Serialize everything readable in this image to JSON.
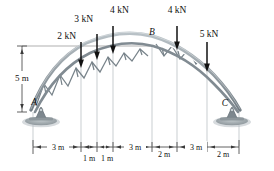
{
  "diagram": {
    "type": "arch-truss-free-body-diagram",
    "nodes": [
      {
        "id": "A",
        "label": "A",
        "role": "pin-support"
      },
      {
        "id": "B",
        "label": "B",
        "role": "apex-joint"
      },
      {
        "id": "C",
        "label": "C",
        "role": "pin-support"
      }
    ],
    "loads": [
      {
        "id": "load-1",
        "label": "2 kN",
        "magnitude": 2,
        "unit": "kN",
        "direction": "down",
        "station_m": 3
      },
      {
        "id": "load-2",
        "label": "3 kN",
        "magnitude": 3,
        "unit": "kN",
        "direction": "down",
        "station_m": 4
      },
      {
        "id": "load-3",
        "label": "4 kN",
        "magnitude": 4,
        "unit": "kN",
        "direction": "down",
        "station_m": 5
      },
      {
        "id": "load-4",
        "label": "4 kN",
        "magnitude": 4,
        "unit": "kN",
        "direction": "down",
        "station_m": 8
      },
      {
        "id": "load-5",
        "label": "5 kN",
        "magnitude": 5,
        "unit": "kN",
        "direction": "down",
        "station_m": 13
      }
    ],
    "height_dimension": {
      "label": "5 m",
      "value": 5,
      "unit": "m"
    },
    "span_dimensions_upper": [
      {
        "label": "3 m",
        "value": 3,
        "unit": "m"
      },
      {
        "label": "3 m",
        "value": 3,
        "unit": "m"
      },
      {
        "label": "3 m",
        "value": 3,
        "unit": "m"
      }
    ],
    "span_dimensions_lower": [
      {
        "label": "1 m",
        "value": 1,
        "unit": "m"
      },
      {
        "label": "1 m",
        "value": 1,
        "unit": "m"
      },
      {
        "label": "2 m",
        "value": 2,
        "unit": "m"
      },
      {
        "label": "2 m",
        "value": 2,
        "unit": "m"
      }
    ],
    "colors": {
      "truss": "#8d979e",
      "truss_dark": "#6f7a81",
      "truss_light": "#b9c2c7",
      "support": "#7d878e",
      "ground": "#9aa3a8",
      "dimension": "#3a3a3a",
      "extension": "#aeb4b8",
      "arrow": "#111111"
    }
  }
}
